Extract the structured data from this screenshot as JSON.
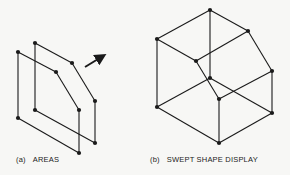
{
  "figure_a": {
    "tag": "(a)",
    "label": "AREAS",
    "front_face": [
      [
        18,
        52
      ],
      [
        56,
        72
      ],
      [
        79,
        110
      ],
      [
        79,
        153
      ],
      [
        18,
        118
      ]
    ],
    "back_face": [
      [
        35,
        43
      ],
      [
        72,
        63
      ],
      [
        95,
        101
      ],
      [
        95,
        143
      ],
      [
        35,
        110
      ]
    ],
    "arrow": {
      "from": [
        85,
        67
      ],
      "to": [
        103,
        56
      ]
    }
  },
  "figure_b": {
    "tag": "(b)",
    "label": "SWEPT SHAPE DISPLAY",
    "vertices": {
      "T": [
        210,
        10
      ],
      "UR": [
        248,
        31
      ],
      "RM": [
        272,
        71
      ],
      "RL": [
        272,
        113
      ],
      "B": [
        219,
        143
      ],
      "LL": [
        157,
        107
      ],
      "LT": [
        157,
        39
      ],
      "IT": [
        196,
        61
      ],
      "C": [
        210,
        78
      ],
      "IC": [
        219,
        99
      ]
    },
    "edges": [
      [
        "T",
        "UR"
      ],
      [
        "T",
        "LT"
      ],
      [
        "T",
        "C"
      ],
      [
        "UR",
        "RM"
      ],
      [
        "RM",
        "RL"
      ],
      [
        "RL",
        "B"
      ],
      [
        "B",
        "LL"
      ],
      [
        "LL",
        "LT"
      ],
      [
        "LT",
        "IT"
      ],
      [
        "IT",
        "UR"
      ],
      [
        "IT",
        "IC"
      ],
      [
        "IC",
        "RM"
      ],
      [
        "IC",
        "B"
      ],
      [
        "C",
        "LL"
      ],
      [
        "C",
        "RL"
      ]
    ]
  },
  "colors": {
    "line": "#1a1a1a",
    "background": "#f7f7f5"
  }
}
